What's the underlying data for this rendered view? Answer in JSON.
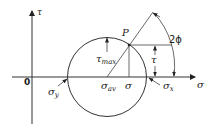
{
  "diagram": {
    "axes": {
      "vertical_label": "τ",
      "horizontal_label": "σ",
      "origin_label": "0"
    },
    "labels": {
      "point": "P",
      "tau_max": "τ",
      "tau_max_sub": "max",
      "sigma_av": "σ",
      "sigma_av_sub": "av",
      "sigma": "σ",
      "tau": "τ",
      "sigma_x": "σ",
      "sigma_x_sub": "x",
      "sigma_y": "σ",
      "sigma_y_sub": "y",
      "angle": "2ϕ"
    },
    "colors": {
      "line": "#333333",
      "text": "#222222",
      "background": "#ffffff"
    }
  }
}
